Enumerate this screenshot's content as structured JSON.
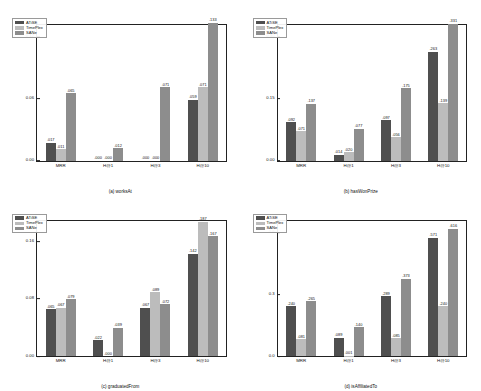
{
  "figure": {
    "legend": [
      {
        "label": "ATiSE",
        "color": "#4f4f4f",
        "key": "c0"
      },
      {
        "label": "TimePlex",
        "color": "#bcbcbc",
        "key": "c1"
      },
      {
        "label": "SANe",
        "color": "#8d8d8d",
        "key": "c2"
      }
    ]
  },
  "chart_data": [
    {
      "type": "bar",
      "panel": "a",
      "title": "(a) worksAt",
      "xlabel": "",
      "ylabel": "",
      "categories": [
        "MRR",
        "H@1",
        "H@3",
        "H@10"
      ],
      "yticks": [
        "0.00",
        "0.06",
        "0.12"
      ],
      "ytickvals": [
        0.0,
        0.06,
        0.12
      ],
      "ylim": [
        0,
        0.132
      ],
      "grid": false,
      "legend_position": "upper-left",
      "series": [
        {
          "name": "ATiSE",
          "values": [
            0.017,
            0.0,
            0.0,
            0.059
          ],
          "labels": [
            ".017",
            ".000",
            ".000",
            ".059"
          ]
        },
        {
          "name": "TimePlex",
          "values": [
            0.011,
            0.0,
            0.0,
            0.071
          ],
          "labels": [
            ".011",
            ".000",
            ".000",
            ".071"
          ]
        },
        {
          "name": "SANe",
          "values": [
            0.065,
            0.012,
            0.071,
            0.133
          ],
          "labels": [
            ".065",
            ".012",
            ".071",
            ".133"
          ]
        }
      ]
    },
    {
      "type": "bar",
      "panel": "b",
      "title": "(b) hasWonPrize",
      "xlabel": "",
      "ylabel": "",
      "categories": [
        "MRR",
        "H@1",
        "H@3",
        "H@10"
      ],
      "yticks": [
        "0.00",
        "0.15",
        "0.30"
      ],
      "ytickvals": [
        0.0,
        0.15,
        0.3
      ],
      "ylim": [
        0,
        0.33
      ],
      "grid": false,
      "legend_position": "upper-left",
      "series": [
        {
          "name": "ATiSE",
          "values": [
            0.092,
            0.014,
            0.097,
            0.263
          ],
          "labels": [
            ".092",
            ".014",
            ".097",
            ".263"
          ]
        },
        {
          "name": "TimePlex",
          "values": [
            0.071,
            0.02,
            0.056,
            0.139
          ],
          "labels": [
            ".071",
            ".020",
            ".056",
            ".139"
          ]
        },
        {
          "name": "SANe",
          "values": [
            0.137,
            0.077,
            0.175,
            0.331
          ],
          "labels": [
            ".137",
            ".077",
            ".175",
            ".331"
          ]
        }
      ]
    },
    {
      "type": "bar",
      "panel": "c",
      "title": "(c) graduatedFrom",
      "xlabel": "",
      "ylabel": "",
      "categories": [
        "MRR",
        "H@1",
        "H@3",
        "H@10"
      ],
      "yticks": [
        "0.00",
        "0.08",
        "0.16"
      ],
      "ytickvals": [
        0.0,
        0.08,
        0.16
      ],
      "ylim": [
        0,
        0.19
      ],
      "grid": false,
      "legend_position": "upper-left",
      "series": [
        {
          "name": "ATiSE",
          "values": [
            0.065,
            0.022,
            0.067,
            0.142
          ],
          "labels": [
            ".065",
            ".022",
            ".067",
            ".142"
          ]
        },
        {
          "name": "TimePlex",
          "values": [
            0.067,
            0.0,
            0.089,
            0.187
          ],
          "labels": [
            ".067",
            ".000",
            ".089",
            ".187"
          ]
        },
        {
          "name": "SANe",
          "values": [
            0.079,
            0.039,
            0.072,
            0.167
          ],
          "labels": [
            ".079",
            ".039",
            ".072",
            ".167"
          ]
        }
      ]
    },
    {
      "type": "bar",
      "panel": "d",
      "title": "(d) isAffiliatedTo",
      "xlabel": "",
      "ylabel": "",
      "categories": [
        "MRR",
        "H@1",
        "H@3",
        "H@10"
      ],
      "yticks": [
        "0.0",
        "0.3",
        "0.6"
      ],
      "ytickvals": [
        0.0,
        0.3,
        0.6
      ],
      "ylim": [
        0,
        0.66
      ],
      "grid": false,
      "legend_position": "upper-left",
      "series": [
        {
          "name": "ATiSE",
          "values": [
            0.24,
            0.089,
            0.289,
            0.571
          ],
          "labels": [
            ".240",
            ".089",
            ".289",
            ".571"
          ]
        },
        {
          "name": "TimePlex",
          "values": [
            0.081,
            0.001,
            0.085,
            0.24
          ],
          "labels": [
            ".081",
            ".001",
            ".085",
            ".240"
          ]
        },
        {
          "name": "SANe",
          "values": [
            0.265,
            0.14,
            0.373,
            0.616
          ],
          "labels": [
            ".265",
            ".140",
            ".373",
            ".616"
          ]
        }
      ]
    }
  ]
}
